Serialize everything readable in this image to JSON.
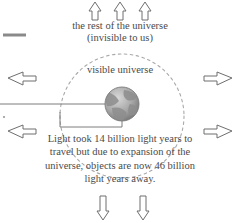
{
  "diagram": {
    "background_color": "#ffffff",
    "ink_color": "#4a4a4a",
    "labels": {
      "rest_of_universe_line1": "the rest of the universe",
      "rest_of_universe_line2": "(invisible to us)",
      "visible_universe": "visible universe",
      "light_travel_line1": "Light took 14 billion light years to",
      "light_travel_line2": "travel but due to expansion of the",
      "light_travel_line3": "universe, objects are now 46 billion",
      "light_travel_line4": "light years away."
    },
    "values": {
      "light_travel_time_billion_light_years": "14 billion light years",
      "current_distance_billion_light_years": "46 billion light years"
    },
    "arrows": {
      "up_count": 3,
      "left_count": 2,
      "right_count": 2,
      "down_count": 2,
      "color": "#6e6e6e"
    },
    "shapes": {
      "visible_universe_circle_style": "dashed",
      "earth_label": "earth",
      "radius_line_label": "radius line from edge to earth",
      "bracket_label": "measurement bracket"
    }
  }
}
